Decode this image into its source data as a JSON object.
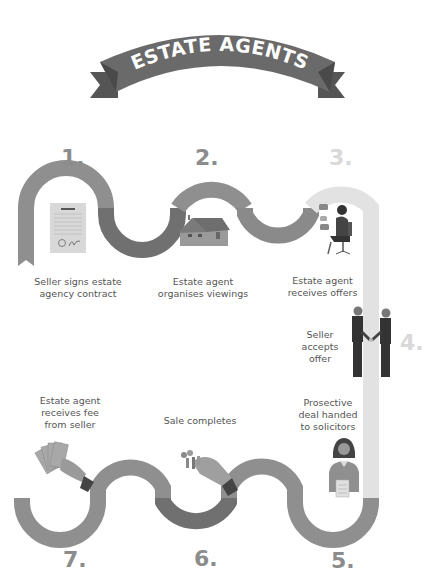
{
  "banner": {
    "title": "ESTATE AGENTS",
    "color": "#6a6a6a",
    "tail_color": "#555555",
    "text_color": "#ffffff"
  },
  "colors": {
    "road_light": "#8f8f8f",
    "road_dark": "#707070",
    "road_pale": "#e2e2e2",
    "road_mid": "#8a8a8a",
    "number_color": "#8c8c8c",
    "number_pale": "#d9d9d9",
    "caption_color": "#555555"
  },
  "steps": [
    {
      "number": "1.",
      "caption_lines": [
        "Seller signs estate",
        "agency contract"
      ],
      "icon": "contract-document-icon"
    },
    {
      "number": "2.",
      "caption_lines": [
        "Estate agent",
        "organises viewings"
      ],
      "icon": "house-icon"
    },
    {
      "number": "3.",
      "caption_lines": [
        "Estate agent",
        "receives offers"
      ],
      "icon": "agent-on-chair-icon"
    },
    {
      "number": "4.",
      "caption_lines": [
        "Seller",
        "accepts",
        "offer"
      ],
      "icon": "handshake-icon"
    },
    {
      "number": "5.",
      "caption_lines": [
        "Prosective",
        "deal handed",
        "to solicitors"
      ],
      "icon": "solicitor-icon"
    },
    {
      "number": "6.",
      "caption_lines": [
        "Sale completes"
      ],
      "icon": "keys-handover-icon"
    },
    {
      "number": "7.",
      "caption_lines": [
        "Estate agent",
        "receives fee",
        "from seller"
      ],
      "icon": "money-fan-icon"
    }
  ]
}
